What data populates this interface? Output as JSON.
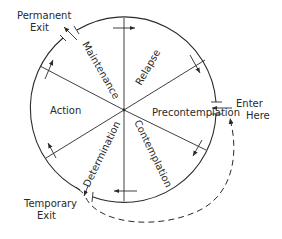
{
  "diagram": {
    "title": "",
    "stages": [
      {
        "id": "precontemplation",
        "label": "Precontemplation"
      },
      {
        "id": "contemplation",
        "label": "Contemplation"
      },
      {
        "id": "determination",
        "label": "Determination"
      },
      {
        "id": "action",
        "label": "Action"
      },
      {
        "id": "maintenance",
        "label": "Maintenance"
      },
      {
        "id": "relapse",
        "label": "Relapse"
      }
    ],
    "entry": {
      "line1": "Enter",
      "line2": "Here"
    },
    "permanent_exit": {
      "line1": "Permanent",
      "line2": "Exit"
    },
    "temporary_exit": {
      "line1": "Temporary",
      "line2": "Exit"
    },
    "flow_direction": "clockwise",
    "colors": {
      "ink": "#2a2a2a",
      "background": "#ffffff"
    }
  }
}
